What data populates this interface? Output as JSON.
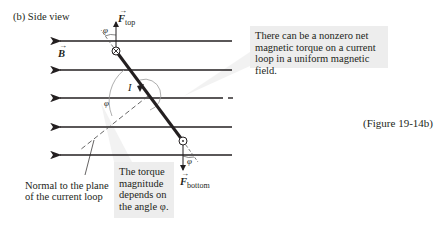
{
  "panel_label": "(b) Side view",
  "figure_caption": "(Figure 19-14b)",
  "field": {
    "symbol": "B",
    "direction": "left",
    "line_ys": [
      41,
      70,
      98,
      127,
      155
    ]
  },
  "forces": {
    "top": {
      "symbol": "F",
      "subscript": "top"
    },
    "bottom": {
      "symbol": "F",
      "subscript": "bottom"
    }
  },
  "current_label": "I",
  "angle_symbol": "φ",
  "normal_label": {
    "line1": "Normal to the plane",
    "line2": "of the current loop"
  },
  "callouts": {
    "top": {
      "line1": "There can be a nonzero net",
      "line2": "magnetic torque on a current",
      "line3": "loop in a uniform magnetic field."
    },
    "bottom": {
      "line1": "The torque",
      "line2": "magnitude",
      "line3": "depends on",
      "line4": "the angle φ."
    }
  },
  "colors": {
    "line": "#231f20",
    "dashed": "#555555",
    "callout_bg": "#ededed",
    "arc": "#999999"
  }
}
